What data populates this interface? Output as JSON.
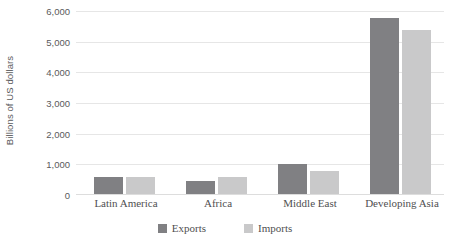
{
  "chart_data": {
    "type": "bar",
    "title": "",
    "subtitle": "",
    "xlabel": "",
    "ylabel": "Billions of US dollars",
    "categories": [
      "Latin America",
      "Africa",
      "Middle East",
      "Developing Asia"
    ],
    "series": [
      {
        "name": "Exports",
        "color": "#808083",
        "values": [
          540,
          440,
          980,
          5750
        ]
      },
      {
        "name": "Imports",
        "color": "#c9c9ca",
        "values": [
          560,
          540,
          740,
          5350
        ]
      }
    ],
    "ylim": [
      0,
      6000
    ],
    "ytick_labels": [
      "6,000",
      "5,000",
      "4,000",
      "3,000",
      "2,000",
      "1,000",
      "0"
    ],
    "ytick_values": [
      6000,
      5000,
      4000,
      3000,
      2000,
      1000,
      0
    ],
    "grid": true,
    "legend_position": "bottom",
    "annotations": []
  },
  "legend": {
    "items": [
      {
        "label": "Exports",
        "color": "#808083",
        "icon": "square-swatch-icon"
      },
      {
        "label": "Imports",
        "color": "#c9c9ca",
        "icon": "square-swatch-icon"
      }
    ]
  },
  "colors": {
    "gridline": "#e6e6e6",
    "axis": "#dddddd",
    "text": "#5a5a5c",
    "background": "#ffffff"
  }
}
